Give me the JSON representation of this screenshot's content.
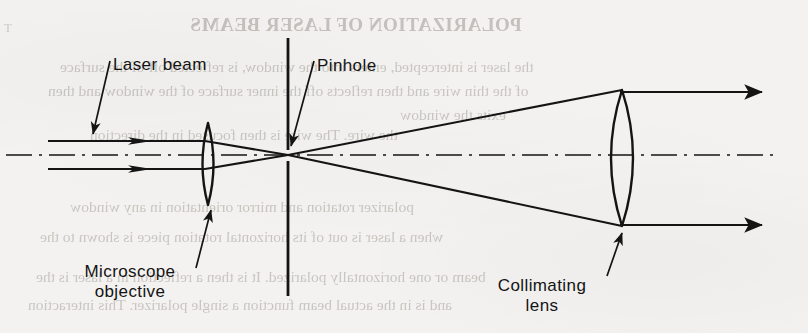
{
  "page": {
    "width": 808,
    "height": 333,
    "background_color": "#f3f2f0",
    "ink_color": "#141414",
    "bleed_color": "#b9b5af"
  },
  "figure": {
    "labels": {
      "laser_beam": "Laser beam",
      "pinhole": "Pinhole",
      "microscope_line1": "Microscope",
      "microscope_line2": "objective",
      "collimating_line1": "Collimating",
      "collimating_line2": "lens"
    },
    "optical_axis": {
      "style": "dash-dot",
      "y": 155,
      "x_start": 6,
      "x_end": 778
    },
    "components": [
      {
        "name": "microscope-objective-lens",
        "type": "biconvex-lens",
        "center_x": 208,
        "center_y": 164,
        "top_y": 123,
        "bottom_y": 205,
        "half_width": 10
      },
      {
        "name": "pinhole-plate",
        "type": "aperture-plate",
        "x": 288,
        "upper_top_y": 38,
        "upper_bottom_y": 150,
        "lower_top_y": 160,
        "lower_bottom_y": 296,
        "aperture_y": 155
      },
      {
        "name": "collimating-lens",
        "type": "biconvex-lens",
        "center_x": 622,
        "center_y": 158,
        "top_y": 90,
        "bottom_y": 226,
        "half_width": 20
      }
    ],
    "rays": {
      "input_upper_y": 141,
      "input_lower_y": 169,
      "input_x_start": 48,
      "focus_x": 288,
      "focus_y": 155,
      "output_upper_y": 92,
      "output_lower_y": 225,
      "output_x_end": 770
    }
  },
  "bleed_through": {
    "heading": "POLARIZATION OF LASER BEAMS",
    "lines": [
      "the laser is intercepted, enters into the window, is reflected off of the surface",
      "of the thin wire and then reflects off the inner surface of the window and then",
      "exits the window",
      "the wire. The wire is then focused in the direction",
      "polarizer rotation and mirror orientation in any window",
      "when a laser is out of its horizontal rotation piece is shown to the",
      "beam or one horizontally polarized. It is then a reflection in a laser is the",
      "and is in the actual beam function a single polarizer. This interaction"
    ]
  }
}
